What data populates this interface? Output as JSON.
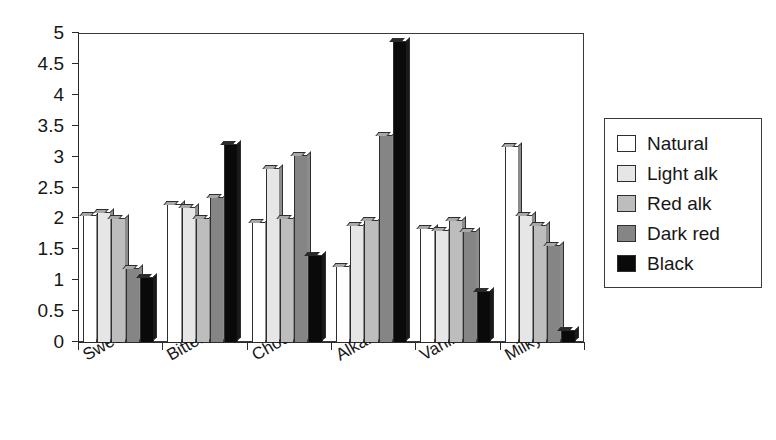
{
  "chart_data": {
    "type": "bar",
    "title": "",
    "xlabel": "",
    "ylabel": "",
    "ylim": [
      0,
      5
    ],
    "ytick_step": 0.5,
    "grid": false,
    "legend_position": "right",
    "categories": [
      "Sweet",
      "Bitter",
      "Chocolate",
      "Alkaline",
      "Vanilla",
      "Milky"
    ],
    "ytick_labels": [
      "0",
      "0.5",
      "1",
      "1.5",
      "2",
      "2.5",
      "3",
      "3.5",
      "4",
      "4.5",
      "5"
    ],
    "series": [
      {
        "name": "Natural",
        "color": "#ffffff",
        "values": [
          2.05,
          2.23,
          1.95,
          1.23,
          1.85,
          3.17
        ]
      },
      {
        "name": "Light alk",
        "color": "#e6e6e6",
        "values": [
          2.1,
          2.18,
          2.82,
          1.9,
          1.82,
          2.05
        ]
      },
      {
        "name": "Red alk",
        "color": "#bdbdbd",
        "values": [
          2.0,
          2.0,
          2.0,
          1.97,
          1.97,
          1.9
        ]
      },
      {
        "name": "Dark red",
        "color": "#858585",
        "values": [
          1.2,
          2.35,
          3.02,
          3.35,
          1.8,
          1.57
        ]
      },
      {
        "name": "Black",
        "color": "#0a0a0a",
        "values": [
          1.05,
          3.2,
          1.4,
          4.87,
          0.83,
          0.2
        ]
      }
    ]
  }
}
